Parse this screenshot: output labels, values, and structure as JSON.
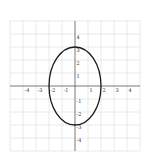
{
  "chart_data": {
    "type": "line",
    "title": "",
    "xlabel": "",
    "ylabel": "",
    "xlim": [
      -5,
      5
    ],
    "ylim": [
      -5,
      5
    ],
    "grid": true,
    "x_tick_labels": [
      "-4",
      "-3",
      "-2",
      "-1",
      "1",
      "2",
      "3",
      "4"
    ],
    "x_ticks": [
      -4,
      -3,
      -2,
      -1,
      1,
      2,
      3,
      4
    ],
    "y_tick_labels": [
      "4",
      "3",
      "2",
      "1",
      "-1",
      "-2",
      "-3",
      "-4"
    ],
    "y_ticks": [
      4,
      3,
      2,
      1,
      -1,
      -2,
      -3,
      -4
    ],
    "series": [
      {
        "name": "ellipse",
        "shape": "ellipse",
        "center": [
          0,
          0
        ],
        "semi_axis_x": 2,
        "semi_axis_y": 3,
        "equation": "x^2/4 + y^2/9 = 1",
        "color": "#1a1a1a"
      }
    ]
  },
  "style": {
    "grid_color": "#c8c8c8",
    "axis_color": "#555555",
    "curve_color": "#1a1a1a"
  }
}
